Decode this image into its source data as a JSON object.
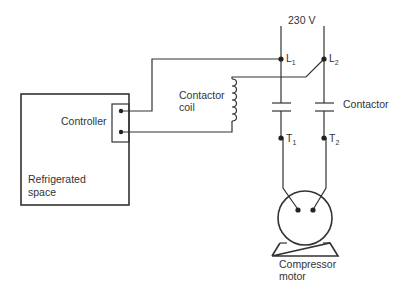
{
  "diagram": {
    "supply_label": "230 V",
    "terminals": {
      "L1": {
        "main": "L",
        "sub": "1"
      },
      "L2": {
        "main": "L",
        "sub": "2"
      },
      "T1": {
        "main": "T",
        "sub": "1"
      },
      "T2": {
        "main": "T",
        "sub": "2"
      }
    },
    "labels": {
      "controller": "Controller",
      "refrigerated_line1": "Refrigerated",
      "refrigerated_line2": "space",
      "coil_line1": "Contactor",
      "coil_line2": "coil",
      "contactor": "Contactor",
      "motor_line1": "Compressor",
      "motor_line2": "motor"
    },
    "colors": {
      "line": "#333333",
      "text": "#333333",
      "background": "#ffffff"
    }
  }
}
